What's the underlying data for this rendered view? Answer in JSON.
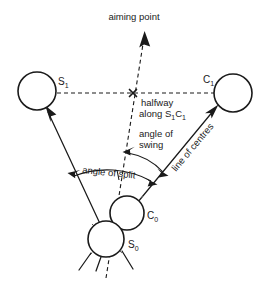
{
  "diagram": {
    "colors": {
      "ink": "#1a1a1a",
      "background": "#ffffff",
      "faint_ink": "#555555"
    },
    "labels": {
      "aiming_point": "aiming point",
      "halfway_line1": "halfway",
      "halfway_line2_pre": "along S",
      "halfway_line2_sub1": "1",
      "halfway_line2_mid": "C",
      "halfway_line2_sub2": "1",
      "angle_of_swing_line1": "angle of",
      "angle_of_swing_line2": "swing",
      "angle_of_split": "angle of split",
      "line_of_centres": "line of centres"
    },
    "balls": [
      {
        "id": "S1",
        "label_main": "S",
        "label_sub": "1",
        "cx": 37,
        "cy": 91,
        "r": 19,
        "label_x": 58,
        "label_y": 85
      },
      {
        "id": "C1",
        "label_main": "C",
        "label_sub": "1",
        "cx": 233,
        "cy": 93,
        "r": 19,
        "label_x": 203,
        "label_y": 83
      },
      {
        "id": "C0",
        "label_main": "C",
        "label_sub": "0",
        "cx": 127,
        "cy": 213,
        "r": 17,
        "label_x": 147,
        "label_y": 219
      },
      {
        "id": "S0",
        "label_main": "S",
        "label_sub": "0",
        "cx": 106,
        "cy": 239,
        "r": 18,
        "label_x": 128,
        "label_y": 248
      }
    ],
    "markers": {
      "halfway_x_mark": {
        "x": 133,
        "y": 93,
        "size": 4
      }
    },
    "geometry_notes": {
      "aiming_line": "dashed line from S0 through halfway point up to aiming point arrow",
      "centres_line": "solid arrow from S0 through C0 up to C1",
      "split_line": "solid arrow from S0 up to S1",
      "s1c1_line": "horizontal dashed line joining S1 and C1 through the halfway cross"
    }
  }
}
